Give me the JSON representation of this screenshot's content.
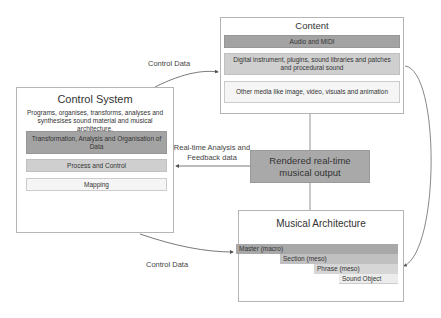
{
  "content": {
    "title": "Content",
    "items": [
      "Audio and MIDI",
      "Digital instrument, plugins, sound libraries and patches and procedural sound",
      "Other media like image, video, visuals and animation"
    ]
  },
  "control_system": {
    "title": "Control System",
    "description": "Programs, organises, transforms, analyses and synthesises sound material and musical architecture.",
    "items": [
      "Transformation, Analysis and Organisation of Data",
      "Process and Control",
      "Mapping"
    ]
  },
  "output": {
    "title": "Rendered real-time musical output"
  },
  "musical_architecture": {
    "title": "Musical Architecture",
    "levels": [
      "Master  (macro)",
      "Section (meso)",
      "Phrase (meso)",
      "Sound Object"
    ]
  },
  "edges": {
    "control_to_content": "Control Data",
    "output_to_control": "Real-time Analysis and Feedback data",
    "control_to_architecture": "Control Data"
  },
  "colors": {
    "dark_fill": "#a3a3a3",
    "mid_fill": "#cfcfcf",
    "light_fill": "#f5f5f5",
    "border": "#b5b5b5",
    "line": "#555555"
  }
}
